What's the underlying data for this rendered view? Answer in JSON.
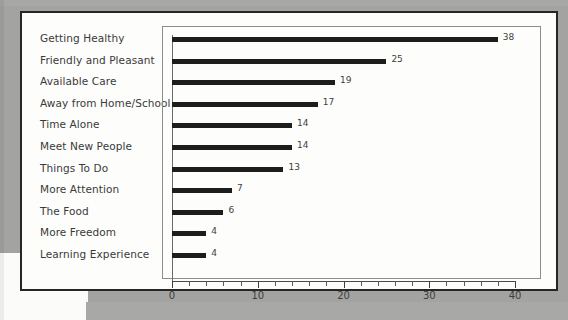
{
  "document": {
    "page_background": "#fdfdfc",
    "scan_background": "#a3a3a1",
    "ink_color": "#1d1d1d"
  },
  "chart_data": {
    "type": "bar",
    "orientation": "horizontal",
    "title": "",
    "subtitle": "",
    "xlabel": "",
    "ylabel": "",
    "grid": false,
    "legend": null,
    "xlim": [
      0,
      40
    ],
    "x_major_ticks": [
      0,
      10,
      20,
      30,
      40
    ],
    "x_tick_labels": [
      "0",
      "10",
      "20",
      "30",
      "40"
    ],
    "x_minor_tick_step": 2,
    "bar_color": "#1d1d1d",
    "categories": [
      "Getting Healthy",
      "Friendly and Pleasant",
      "Available Care",
      "Away from Home/School",
      "Time Alone",
      "Meet New People",
      "Things To Do",
      "More Attention",
      "The Food",
      "More Freedom",
      "Learning Experience"
    ],
    "values": [
      38,
      25,
      19,
      17,
      14,
      14,
      13,
      7,
      6,
      4,
      4
    ],
    "value_labels": [
      "38",
      "25",
      "19",
      "17",
      "14",
      "14",
      "13",
      "7",
      "6",
      "4",
      "4"
    ]
  }
}
